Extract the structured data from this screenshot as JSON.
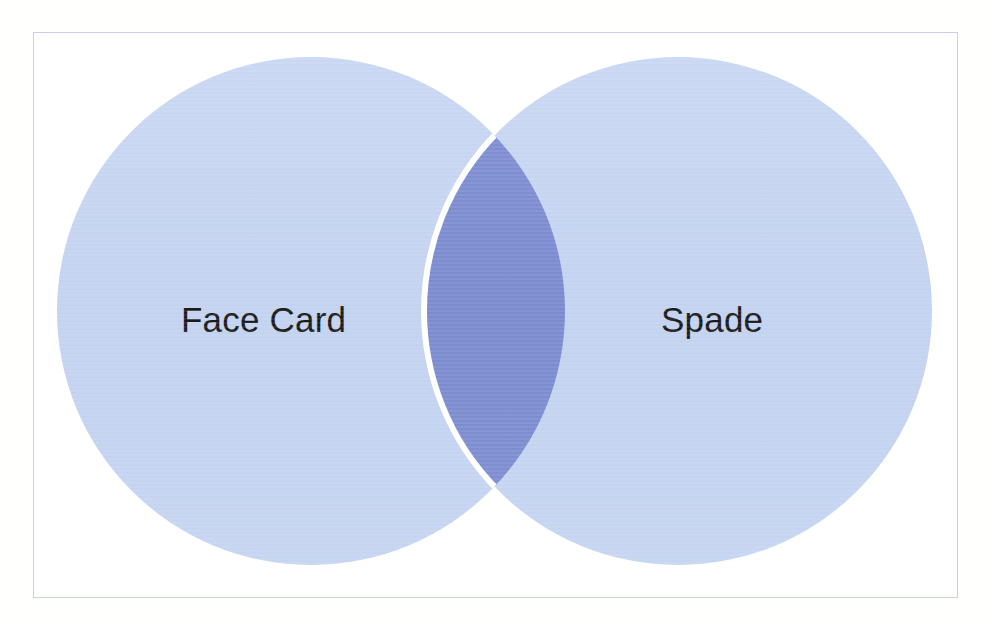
{
  "page": {
    "background_color": "#ffffff",
    "width": 986,
    "height": 626
  },
  "frame": {
    "border_color": "#c6d2ea",
    "fill_color": "#ffffff"
  },
  "diagram": {
    "type": "venn",
    "set_count": 2,
    "title": "",
    "sets": [
      {
        "id": "left",
        "label": "Face Card",
        "fill_color": "#c3d3f0",
        "center_x": 311,
        "center_y": 311,
        "radius": 254
      },
      {
        "id": "right",
        "label": "Spade",
        "fill_color": "#c3d3f0",
        "center_x": 678,
        "center_y": 311,
        "radius": 254
      }
    ],
    "intersection": {
      "label": "",
      "fill_color": "#7b8cd0",
      "outline_color": "#ffffff"
    },
    "label_text_color": "#1b1b1b"
  },
  "chart_data": {
    "type": "venn",
    "title": "",
    "categories": [
      "Face Card",
      "Spade"
    ],
    "region_labels": [
      "",
      "",
      ""
    ],
    "legend": [],
    "colors": {
      "set_fill": "#c3d3f0",
      "intersection_fill": "#7b8cd0",
      "frame": "#c6d2ea",
      "text": "#1b1b1b"
    }
  }
}
